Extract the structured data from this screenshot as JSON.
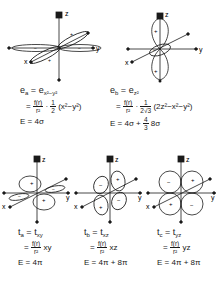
{
  "colors": {
    "ink": "#1a1a1a",
    "background": "#ffffff"
  },
  "axes": {
    "x": "x",
    "y": "y",
    "z": "z"
  },
  "signs": {
    "plus": "+",
    "minus": "−"
  },
  "orbitals": [
    {
      "id": "ea",
      "symbol": "e",
      "sub": "a",
      "equals_symbol": "e",
      "equals_sub": "x²−y²",
      "numerator": "f(r)",
      "denominator": "r²",
      "factor_num": "1",
      "factor_den": "2",
      "polynomial": "(x²−y²)",
      "energy_label": "E",
      "energy": "= 4σ"
    },
    {
      "id": "eb",
      "symbol": "e",
      "sub": "b",
      "equals_symbol": "e",
      "equals_sub": "z²",
      "numerator": "f(r)",
      "denominator": "r²",
      "factor_num": "1",
      "factor_den": "2√3",
      "polynomial": "(2z²−x²−y²)",
      "energy_label": "E",
      "energy": "= 4σ + ",
      "energy_frac_num": "4",
      "energy_frac_den": "3",
      "energy_tail": "8σ"
    },
    {
      "id": "ta",
      "symbol": "t",
      "sub": "a",
      "equals_symbol": "t",
      "equals_sub": "xy",
      "numerator": "f(r)",
      "denominator": "r²",
      "polynomial": "xy",
      "energy_label": "E",
      "energy": "= 4π"
    },
    {
      "id": "tb",
      "symbol": "t",
      "sub": "b",
      "equals_symbol": "t",
      "equals_sub": "xz",
      "numerator": "f(r)",
      "denominator": "r²",
      "polynomial": "xz",
      "energy_label": "E",
      "energy": "= 4π + 8π"
    },
    {
      "id": "tc",
      "symbol": "t",
      "sub": "c",
      "equals_symbol": "t",
      "equals_sub": "yz",
      "numerator": "f(r)",
      "denominator": "r²",
      "polynomial": "yz",
      "energy_label": "E",
      "energy": "= 4π + 8π"
    }
  ]
}
